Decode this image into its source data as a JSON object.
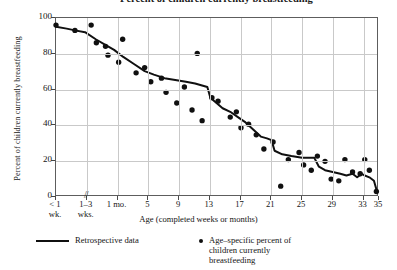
{
  "chart_data": {
    "type": "scatter",
    "title": "Percent of children currently breastfeeding",
    "xlabel": "Age (completed weeks or months)",
    "ylabel": "Percent of children currently breastfeeding",
    "ylim": [
      0,
      100
    ],
    "yticks": [
      0,
      20,
      40,
      60,
      80,
      100
    ],
    "grid": true,
    "legend_position": "below-plot",
    "x_axis_break_after_index": 1,
    "xticks": [
      {
        "label_line1": "< 1",
        "label_line2": "wk.",
        "pos": 0
      },
      {
        "label_line1": "1–3",
        "label_line2": "wks.",
        "pos": 1
      },
      {
        "label_line1": "1 mo.",
        "label_line2": "",
        "pos": 2
      },
      {
        "label_line1": "5",
        "label_line2": "",
        "pos": 3
      },
      {
        "label_line1": "9",
        "label_line2": "",
        "pos": 4
      },
      {
        "label_line1": "13",
        "label_line2": "",
        "pos": 5
      },
      {
        "label_line1": "17",
        "label_line2": "",
        "pos": 6
      },
      {
        "label_line1": "21",
        "label_line2": "",
        "pos": 7
      },
      {
        "label_line1": "25",
        "label_line2": "",
        "pos": 8
      },
      {
        "label_line1": "29",
        "label_line2": "",
        "pos": 9
      },
      {
        "label_line1": "33",
        "label_line2": "",
        "pos": 10
      },
      {
        "label_line1": "35",
        "label_line2": "",
        "pos": 10.5
      }
    ],
    "series": [
      {
        "name": "Retrospective data",
        "type": "line",
        "color": "#101010",
        "points": [
          {
            "x": 0.0,
            "y": 95
          },
          {
            "x": 0.35,
            "y": 94
          },
          {
            "x": 0.62,
            "y": 93
          },
          {
            "x": 0.95,
            "y": 92
          },
          {
            "x": 1.3,
            "y": 88
          },
          {
            "x": 1.6,
            "y": 85
          },
          {
            "x": 1.9,
            "y": 82
          },
          {
            "x": 2.2,
            "y": 78
          },
          {
            "x": 2.55,
            "y": 74
          },
          {
            "x": 2.9,
            "y": 70
          },
          {
            "x": 3.2,
            "y": 68
          },
          {
            "x": 3.55,
            "y": 66
          },
          {
            "x": 3.9,
            "y": 65
          },
          {
            "x": 4.25,
            "y": 64
          },
          {
            "x": 4.55,
            "y": 63
          },
          {
            "x": 4.75,
            "y": 62
          },
          {
            "x": 4.95,
            "y": 61
          },
          {
            "x": 5.05,
            "y": 55
          },
          {
            "x": 5.25,
            "y": 52
          },
          {
            "x": 5.45,
            "y": 49
          },
          {
            "x": 5.7,
            "y": 47
          },
          {
            "x": 5.95,
            "y": 44
          },
          {
            "x": 6.2,
            "y": 41
          },
          {
            "x": 6.45,
            "y": 37
          },
          {
            "x": 6.7,
            "y": 33
          },
          {
            "x": 6.9,
            "y": 32
          },
          {
            "x": 7.05,
            "y": 31
          },
          {
            "x": 7.15,
            "y": 25
          },
          {
            "x": 7.4,
            "y": 23
          },
          {
            "x": 7.7,
            "y": 22
          },
          {
            "x": 8.05,
            "y": 21
          },
          {
            "x": 8.45,
            "y": 21
          },
          {
            "x": 8.6,
            "y": 16
          },
          {
            "x": 8.8,
            "y": 14
          },
          {
            "x": 9.05,
            "y": 13
          },
          {
            "x": 9.3,
            "y": 12
          },
          {
            "x": 9.5,
            "y": 11
          },
          {
            "x": 9.7,
            "y": 12
          },
          {
            "x": 9.85,
            "y": 10
          },
          {
            "x": 10.0,
            "y": 12
          },
          {
            "x": 10.1,
            "y": 11
          },
          {
            "x": 10.25,
            "y": 10
          },
          {
            "x": 10.4,
            "y": 8
          },
          {
            "x": 10.5,
            "y": 2
          }
        ]
      },
      {
        "name": "Age-specific percent of children currently breastfeeding",
        "type": "scatter",
        "color": "#101010",
        "points": [
          {
            "x": 0.0,
            "y": 96
          },
          {
            "x": 0.62,
            "y": 93
          },
          {
            "x": 1.15,
            "y": 96
          },
          {
            "x": 1.32,
            "y": 86
          },
          {
            "x": 1.62,
            "y": 84
          },
          {
            "x": 1.7,
            "y": 79
          },
          {
            "x": 2.05,
            "y": 75
          },
          {
            "x": 2.18,
            "y": 88
          },
          {
            "x": 2.62,
            "y": 69
          },
          {
            "x": 2.9,
            "y": 72
          },
          {
            "x": 3.1,
            "y": 64
          },
          {
            "x": 3.45,
            "y": 66
          },
          {
            "x": 3.6,
            "y": 58
          },
          {
            "x": 3.95,
            "y": 52
          },
          {
            "x": 4.2,
            "y": 61
          },
          {
            "x": 4.45,
            "y": 48
          },
          {
            "x": 4.62,
            "y": 80
          },
          {
            "x": 4.78,
            "y": 42
          },
          {
            "x": 5.1,
            "y": 55
          },
          {
            "x": 5.3,
            "y": 53
          },
          {
            "x": 5.7,
            "y": 44
          },
          {
            "x": 5.9,
            "y": 47
          },
          {
            "x": 6.05,
            "y": 38
          },
          {
            "x": 6.3,
            "y": 40
          },
          {
            "x": 6.55,
            "y": 34
          },
          {
            "x": 6.8,
            "y": 26
          },
          {
            "x": 7.1,
            "y": 30
          },
          {
            "x": 7.35,
            "y": 5
          },
          {
            "x": 7.6,
            "y": 20
          },
          {
            "x": 7.95,
            "y": 24
          },
          {
            "x": 8.1,
            "y": 17
          },
          {
            "x": 8.35,
            "y": 14
          },
          {
            "x": 8.55,
            "y": 22
          },
          {
            "x": 8.8,
            "y": 19
          },
          {
            "x": 9.0,
            "y": 9
          },
          {
            "x": 9.25,
            "y": 8
          },
          {
            "x": 9.45,
            "y": 20
          },
          {
            "x": 9.7,
            "y": 13
          },
          {
            "x": 9.95,
            "y": 12
          },
          {
            "x": 10.1,
            "y": 20
          },
          {
            "x": 10.25,
            "y": 14
          },
          {
            "x": 10.48,
            "y": 2
          }
        ]
      }
    ]
  },
  "legend": {
    "line_label": "Retrospective data",
    "dot_label_line1": "Age–specific percent of",
    "dot_label_line2": "children currently",
    "dot_label_line3": "breastfeeding"
  }
}
